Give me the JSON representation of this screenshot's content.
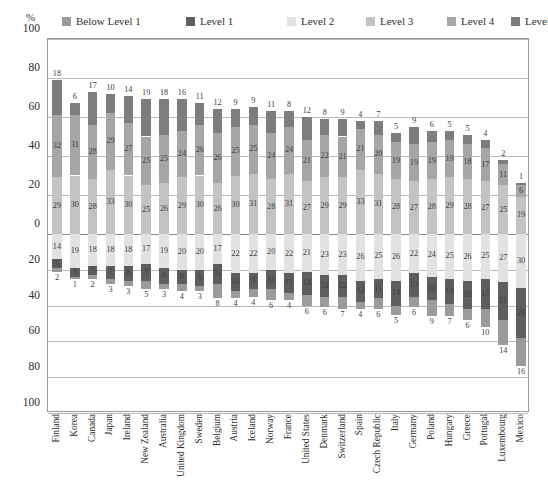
{
  "axis": {
    "unit_label": "%",
    "yticks_top": [
      100,
      80,
      60,
      40,
      20,
      0
    ],
    "yticks_bottom": [
      20,
      40,
      60,
      80,
      100
    ]
  },
  "legend": {
    "items": [
      {
        "label": "Below Level 1",
        "color": "#9b9b9b"
      },
      {
        "label": "Level 1",
        "color": "#5e5e5e"
      },
      {
        "label": "Level 2",
        "color": "#e2e2e2"
      },
      {
        "label": "Level 3",
        "color": "#c3c3c3"
      },
      {
        "label": "Level 4",
        "color": "#a6a6a6"
      },
      {
        "label": "Level 5",
        "color": "#7d7d7d"
      }
    ]
  },
  "chart_data": {
    "type": "bar",
    "subtype": "diverging-stacked-bar",
    "title": "",
    "xlabel": "",
    "ylabel": "%",
    "ylim": [
      -100,
      100
    ],
    "grid": true,
    "legend_position": "top",
    "categories": [
      "Finland",
      "Korea",
      "Canada",
      "Japan",
      "Ireland",
      "New Zealand",
      "Australia",
      "United Kingdom",
      "Sweden",
      "Belgium",
      "Austria",
      "Iceland",
      "Norway",
      "France",
      "United States",
      "Denmark",
      "Switzerland",
      "Spain",
      "Czech Republic",
      "Italy",
      "Germany",
      "Poland",
      "Hungary",
      "Greece",
      "Portugal",
      "Luxembourg",
      "Mexico"
    ],
    "series": [
      {
        "name": "Level 5",
        "color": "#7d7d7d",
        "values": [
          18,
          6,
          17,
          10,
          14,
          19,
          18,
          16,
          11,
          12,
          9,
          9,
          11,
          8,
          12,
          8,
          9,
          4,
          7,
          5,
          9,
          6,
          5,
          5,
          4,
          2,
          1
        ]
      },
      {
        "name": "Level 4",
        "color": "#a6a6a6",
        "values": [
          32,
          31,
          28,
          29,
          27,
          25,
          25,
          24,
          26,
          26,
          25,
          25,
          24,
          24,
          21,
          22,
          21,
          21,
          20,
          19,
          19,
          19,
          19,
          18,
          17,
          11,
          6
        ]
      },
      {
        "name": "Level 3",
        "color": "#c3c3c3",
        "values": [
          29,
          30,
          28,
          33,
          30,
          25,
          26,
          29,
          30,
          26,
          30,
          31,
          28,
          31,
          27,
          29,
          29,
          33,
          31,
          28,
          27,
          28,
          29,
          28,
          27,
          25,
          19
        ]
      },
      {
        "name": "Level 2",
        "color": "#e2e2e2",
        "values": [
          14,
          19,
          18,
          18,
          18,
          17,
          19,
          20,
          20,
          17,
          22,
          22,
          20,
          22,
          21,
          23,
          23,
          26,
          25,
          26,
          22,
          24,
          25,
          26,
          25,
          27,
          30
        ]
      },
      {
        "name": "Level 1",
        "color": "#5e5e5e",
        "values": [
          5,
          5,
          5,
          7,
          8,
          9,
          9,
          8,
          9,
          11,
          10,
          9,
          11,
          11,
          13,
          12,
          12,
          12,
          11,
          14,
          13,
          13,
          14,
          16,
          17,
          21,
          28
        ]
      },
      {
        "name": "Below Level 1",
        "color": "#9b9b9b",
        "values": [
          2,
          1,
          2,
          3,
          3,
          5,
          3,
          4,
          3,
          8,
          4,
          4,
          6,
          4,
          6,
          6,
          7,
          4,
          6,
          5,
          6,
          9,
          7,
          6,
          10,
          14,
          16
        ]
      }
    ],
    "notes": {
      "axis_split": "Levels 3,4,5 stack upward from the 0 line; Levels 2,1 and Below Level 1 stack downward.",
      "upward_series": [
        "Level 3",
        "Level 4",
        "Level 5"
      ],
      "downward_series": [
        "Level 2",
        "Level 1",
        "Below Level 1"
      ]
    }
  }
}
